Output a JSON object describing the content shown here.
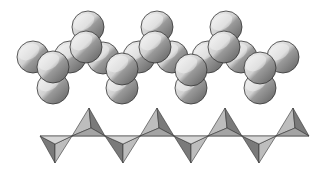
{
  "diagram": {
    "type": "silicate-chain-structure",
    "colors": {
      "background": "#ffffff",
      "sphere_light": "#f4f4f4",
      "sphere_mid": "#c2c2c2",
      "sphere_dark": "#6e6e6e",
      "outline": "#333333",
      "tetra_light": "#bdbdbd",
      "tetra_dark": "#7a7a7a",
      "baseline": "#8a8a8a"
    },
    "sphere_radius": 16,
    "spheres": [
      {
        "x": 33,
        "y": 57
      },
      {
        "x": 70,
        "y": 57
      },
      {
        "x": 103,
        "y": 58
      },
      {
        "x": 139,
        "y": 57
      },
      {
        "x": 172,
        "y": 57
      },
      {
        "x": 208,
        "y": 57
      },
      {
        "x": 241,
        "y": 57
      },
      {
        "x": 283,
        "y": 57
      },
      {
        "x": 88,
        "y": 27
      },
      {
        "x": 157,
        "y": 27
      },
      {
        "x": 226,
        "y": 27
      },
      {
        "x": 53,
        "y": 88
      },
      {
        "x": 122,
        "y": 88
      },
      {
        "x": 191,
        "y": 88
      },
      {
        "x": 260,
        "y": 88
      },
      {
        "x": 86,
        "y": 47
      },
      {
        "x": 155,
        "y": 47
      },
      {
        "x": 224,
        "y": 47
      },
      {
        "x": 53,
        "y": 67
      },
      {
        "x": 122,
        "y": 69
      },
      {
        "x": 191,
        "y": 70
      },
      {
        "x": 260,
        "y": 68
      }
    ],
    "baseline": {
      "x1": 40,
      "x2": 309,
      "y": 136
    },
    "tetrahedra_up": [
      {
        "apex_x": 89,
        "apex_y": 108,
        "left_x": 72,
        "right_x": 105,
        "base_y": 136
      },
      {
        "apex_x": 157,
        "apex_y": 108,
        "left_x": 140,
        "right_x": 174,
        "base_y": 136
      },
      {
        "apex_x": 225,
        "apex_y": 108,
        "left_x": 208,
        "right_x": 242,
        "base_y": 136
      },
      {
        "apex_x": 293,
        "apex_y": 108,
        "left_x": 276,
        "right_x": 309,
        "base_y": 136
      }
    ],
    "tetrahedra_down": [
      {
        "apex_x": 55,
        "apex_y": 163,
        "left_x": 40,
        "right_x": 72,
        "top_y": 136
      },
      {
        "apex_x": 123,
        "apex_y": 163,
        "left_x": 105,
        "right_x": 140,
        "top_y": 136
      },
      {
        "apex_x": 191,
        "apex_y": 163,
        "left_x": 174,
        "right_x": 208,
        "top_y": 136
      },
      {
        "apex_x": 259,
        "apex_y": 163,
        "left_x": 242,
        "right_x": 276,
        "top_y": 136
      }
    ]
  }
}
